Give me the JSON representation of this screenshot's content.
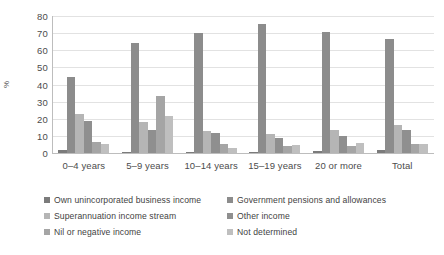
{
  "chart_data": {
    "type": "bar",
    "title": "",
    "subtitle": "",
    "xlabel": "",
    "ylabel": "%",
    "ylim": [
      0,
      80
    ],
    "ytick_step": 10,
    "yticks": [
      "80",
      "70",
      "60",
      "50",
      "40",
      "30",
      "20",
      "10",
      "0"
    ],
    "grid": true,
    "legend_position": "bottom",
    "legend_columns": 2,
    "categories": [
      "0–4 years",
      "5–9 years",
      "10–14 years",
      "15–19 years",
      "20 or more",
      "Total"
    ],
    "series": [
      {
        "name": "Own unincorporated business income",
        "color": "#7b7b7b",
        "values": [
          1.5,
          0.5,
          0.5,
          0.5,
          1.2,
          1.5
        ]
      },
      {
        "name": "Government pensions and allowances",
        "color": "#8c8c8c",
        "values": [
          44.5,
          64.0,
          70.0,
          75.5,
          70.5,
          66.5
        ]
      },
      {
        "name": "Superannuation income stream",
        "color": "#b5b5b5",
        "values": [
          23.0,
          18.0,
          13.0,
          11.0,
          13.5,
          16.3
        ]
      },
      {
        "name": "Other income",
        "color": "#8f8f8f",
        "values": [
          18.8,
          13.5,
          11.5,
          8.8,
          10.2,
          13.3
        ]
      },
      {
        "name": "Nil or negative income",
        "color": "#a5a5a5",
        "values": [
          6.3,
          33.5,
          5.0,
          4.0,
          4.2,
          5.0
        ]
      },
      {
        "name": "Not determined",
        "color": "#bfbfbf",
        "values": [
          5.3,
          21.5,
          3.0,
          4.8,
          6.0,
          5.0
        ]
      }
    ]
  },
  "axis": {
    "y_title": "%"
  },
  "colors": {
    "gridline": "#e2e2e2",
    "axis": "#bdbdbd",
    "text": "#4c4c4c",
    "background": "#ffffff"
  }
}
